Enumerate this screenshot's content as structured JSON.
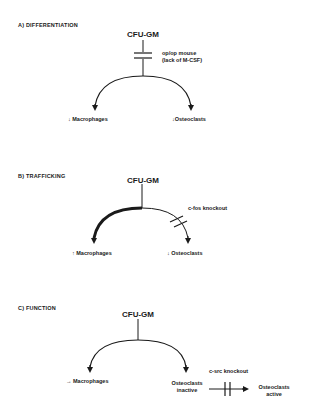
{
  "panels": [
    {
      "title": "A)  DIFFERENTIATION",
      "root": "CFU-GM",
      "block": {
        "line1": "op/op mouse",
        "line2": "(lack of M-CSF)"
      },
      "left": {
        "arrow": "↓",
        "label": "Macrophages"
      },
      "right": {
        "arrow": "↓",
        "label": "Osteoclasts"
      }
    },
    {
      "title": "B)  TRAFFICKING",
      "root": "CFU-GM",
      "block": {
        "line1": "c-fos knockout"
      },
      "left": {
        "arrow": "↑",
        "label": "Macrophages"
      },
      "right": {
        "arrow": "↓",
        "label": "Osteoclasts"
      }
    },
    {
      "title": "C)  FUNCTION",
      "root": "CFU-GM",
      "left": {
        "arrow": "→",
        "label": "Macrophages"
      },
      "right": {
        "line1": "Osteoclasts",
        "line2": "inactive"
      },
      "block": {
        "line1": "c-src knockout"
      },
      "final": {
        "line1": "Osteoclasts",
        "line2": "active"
      }
    }
  ],
  "colors": {
    "ink": "#1a1a1a",
    "background": "#ffffff"
  }
}
